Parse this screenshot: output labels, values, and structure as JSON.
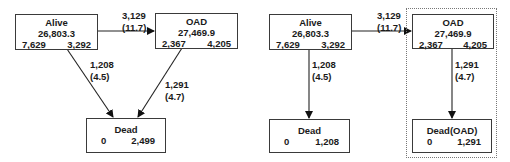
{
  "left_diagram": {
    "alive": {
      "title": "Alive",
      "value": "26,803.3",
      "left": "7,629",
      "right": "3,292"
    },
    "oad": {
      "title": "OAD",
      "value": "27,469.9",
      "left": "2,367",
      "right": "4,205"
    },
    "dead": {
      "title": "Dead",
      "left": "0",
      "right": "2,499"
    },
    "edge_alive_oad": {
      "count": "3,129",
      "rate": "(11.7)"
    },
    "edge_alive_dead": {
      "count": "1,208",
      "rate": "(4.5)"
    },
    "edge_oad_dead": {
      "count": "1,291",
      "rate": "(4.7)"
    }
  },
  "right_diagram": {
    "alive": {
      "title": "Alive",
      "value": "26,803.3",
      "left": "7,629",
      "right": "3,292"
    },
    "oad": {
      "title": "OAD",
      "value": "27,469.9",
      "left": "2,367",
      "right": "4,205"
    },
    "dead": {
      "title": "Dead",
      "left": "0",
      "right": "1,208"
    },
    "dead_oad": {
      "title": "Dead(OAD)",
      "left": "0",
      "right": "1,291"
    },
    "edge_alive_oad": {
      "count": "3,129",
      "rate": "(11.7)"
    },
    "edge_alive_dead": {
      "count": "1,208",
      "rate": "(4.5)"
    },
    "edge_oad_dead": {
      "count": "1,291",
      "rate": "(4.7)"
    }
  }
}
